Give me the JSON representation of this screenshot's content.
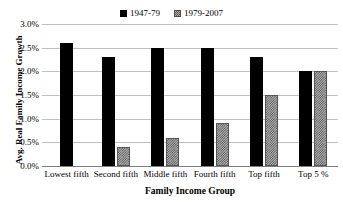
{
  "chart_data": {
    "type": "bar",
    "title": "",
    "subtitle": "",
    "xlabel": "Family Income Group",
    "ylabel": "Avg. Real Family Income Growth",
    "categories": [
      "Lowest fifth",
      "Second fifth",
      "Middle fifth",
      "Fourth fifth",
      "Top fifth",
      "Top 5 %"
    ],
    "series": [
      {
        "name": "1947-79",
        "color": "#000000",
        "fill": "solid",
        "values": [
          2.6,
          2.3,
          2.5,
          2.5,
          2.3,
          2.0
        ]
      },
      {
        "name": "1979-2007",
        "color": "#b4b4b4",
        "fill": "hatched",
        "values": [
          0.0,
          0.4,
          0.6,
          0.9,
          1.5,
          2.0
        ]
      }
    ],
    "ylim": [
      0.0,
      3.0
    ],
    "ytick_values": [
      0.0,
      0.5,
      1.0,
      1.5,
      2.0,
      2.5,
      3.0
    ],
    "ytick_labels": [
      "0.0%",
      "0.5%",
      "1.0%",
      "1.5%",
      "2.0%",
      "2.5%",
      "3.0%"
    ],
    "value_unit": "%",
    "grid": "horizontal",
    "legend_position": "top-center",
    "background_color": "#ffffff",
    "gridline_color": "#bfbfbf"
  }
}
